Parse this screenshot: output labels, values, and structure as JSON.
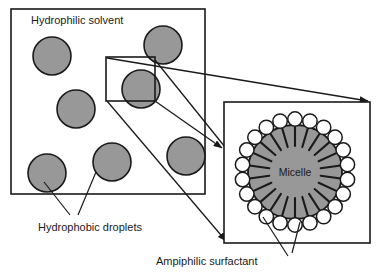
{
  "figure": {
    "background_color": "#ffffff",
    "line_color": "#1a1a1a",
    "droplet_fill": "#989898",
    "micelle_fill": "#989898",
    "head_fill": "#ffffff"
  },
  "labels": {
    "hydrophilic_solvent": "Hydrophilic solvent",
    "hydrophobic_droplets": "Hydrophobic droplets",
    "ampiphilic_surfactant": "Ampiphilic surfactant",
    "micelle": "Micelle"
  },
  "left_panel": {
    "name": "solvent-panel",
    "x": 11,
    "y": 9,
    "width": 194,
    "height": 185,
    "droplets": [
      {
        "cx": 41,
        "cy": 47,
        "r": 19
      },
      {
        "cx": 152,
        "cy": 36,
        "r": 19
      },
      {
        "cx": 65,
        "cy": 100,
        "r": 19
      },
      {
        "cx": 130,
        "cy": 80,
        "r": 19
      },
      {
        "cx": 36,
        "cy": 164,
        "r": 19
      },
      {
        "cx": 101,
        "cy": 153,
        "r": 19
      },
      {
        "cx": 175,
        "cy": 147,
        "r": 19
      }
    ],
    "callout_box": {
      "x": 106,
      "y": 57,
      "width": 49,
      "height": 44
    }
  },
  "right_panel": {
    "name": "micelle-detail-panel",
    "x": 224,
    "y": 102,
    "width": 146,
    "height": 141,
    "micelle": {
      "cx": 295,
      "cy": 172,
      "core_r": 47,
      "surfactant_count": 22,
      "head_r": 7.2,
      "head_orbit_r": 53,
      "tail_inner_r": 26,
      "tail_outer_r": 46
    }
  },
  "connectors": {
    "expansion_lines": 3,
    "arrowheads": 3
  }
}
